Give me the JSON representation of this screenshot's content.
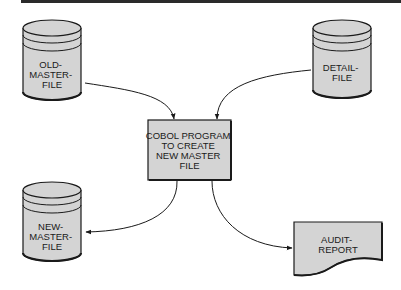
{
  "diagram": {
    "colors": {
      "shape_fill": "#d4d4d4",
      "stroke": "#1a1a1a",
      "background": "#ffffff",
      "top_bar": "#2a2a2a"
    },
    "nodes": {
      "old_master_file": {
        "type": "disk-cylinder",
        "lines": [
          "OLD-",
          "MASTER-",
          "FILE"
        ]
      },
      "detail_file": {
        "type": "disk-cylinder",
        "lines": [
          "DETAIL-",
          "FILE"
        ]
      },
      "program": {
        "type": "process-box",
        "lines": [
          "COBOL PROGRAM",
          "TO CREATE",
          "NEW MASTER",
          "FILE"
        ]
      },
      "new_master_file": {
        "type": "disk-cylinder",
        "lines": [
          "NEW-",
          "MASTER-",
          "FILE"
        ]
      },
      "audit_report": {
        "type": "document",
        "lines": [
          "AUDIT-",
          "REPORT"
        ]
      }
    },
    "edges": [
      {
        "from": "old_master_file",
        "to": "program"
      },
      {
        "from": "detail_file",
        "to": "program"
      },
      {
        "from": "program",
        "to": "new_master_file"
      },
      {
        "from": "program",
        "to": "audit_report"
      }
    ]
  }
}
